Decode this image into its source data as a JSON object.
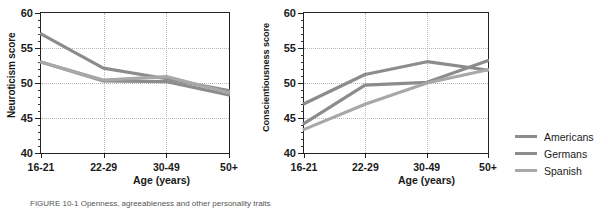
{
  "figure": {
    "caption": "FIGURE 10-1  Openness, agreeableness and other personality traits"
  },
  "legend": {
    "position": "right",
    "items": [
      {
        "label": "Americans",
        "color": "#8c8c8c"
      },
      {
        "label": "Germans",
        "color": "#8c8c8c"
      },
      {
        "label": "Spanish",
        "color": "#a8a8a8"
      }
    ]
  },
  "chart_data": [
    {
      "type": "line",
      "title": "",
      "xlabel": "Age (years)",
      "ylabel": "Neuroticism score",
      "categories": [
        "16-21",
        "22-29",
        "30-49",
        "50+"
      ],
      "ylim": [
        40,
        60
      ],
      "yticks": [
        40,
        45,
        50,
        55,
        60
      ],
      "grid": true,
      "series": [
        {
          "name": "Americans",
          "values": [
            57.0,
            52.1,
            50.6,
            48.9
          ]
        },
        {
          "name": "Germans",
          "values": [
            53.0,
            50.3,
            50.2,
            48.3
          ]
        },
        {
          "name": "Spanish",
          "values": [
            53.0,
            50.4,
            50.9,
            48.6
          ]
        }
      ]
    },
    {
      "type": "line",
      "title": "",
      "xlabel": "Age (years)",
      "ylabel": "Conscientiousness score",
      "categories": [
        "16-21",
        "22-29",
        "30-49",
        "50+"
      ],
      "ylim": [
        40,
        60
      ],
      "yticks": [
        40,
        45,
        50,
        55,
        60
      ],
      "grid": true,
      "series": [
        {
          "name": "Americans",
          "values": [
            47.0,
            51.2,
            53.0,
            51.8
          ]
        },
        {
          "name": "Germans",
          "values": [
            44.2,
            49.7,
            50.1,
            53.2
          ]
        },
        {
          "name": "Spanish",
          "values": [
            43.4,
            47.0,
            50.0,
            51.9
          ]
        }
      ]
    }
  ]
}
